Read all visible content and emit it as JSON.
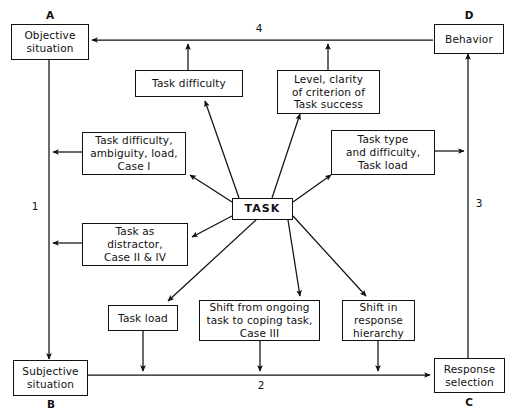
{
  "diagram": {
    "nodes": [
      {
        "id": "objective_situation",
        "label": "Objective\nsituation"
      },
      {
        "id": "behavior",
        "label": "Behavior"
      },
      {
        "id": "task_difficulty",
        "label": "Task difficulty"
      },
      {
        "id": "level_clarity",
        "label": "Level, clarity\nof criterion of\nTask success"
      },
      {
        "id": "task_difficulty_ambiguity",
        "label": "Task difficulty,\nambiguity, load,\nCase I"
      },
      {
        "id": "task_type",
        "label": "Task type\nand difficulty,\nTask load"
      },
      {
        "id": "task",
        "label": "TASK"
      },
      {
        "id": "task_as_distractor",
        "label": "Task as\ndistractor,\nCase II & IV"
      },
      {
        "id": "task_load",
        "label": "Task load"
      },
      {
        "id": "shift_from_ongoing",
        "label": "Shift from ongoing\ntask to coping task,\nCase III"
      },
      {
        "id": "shift_in_response",
        "label": "Shift in\nresponse\nhierarchy"
      },
      {
        "id": "subjective_situation",
        "label": "Subjective\nsituation"
      },
      {
        "id": "response_selection",
        "label": "Response\nselection"
      }
    ],
    "corner_labels": [
      {
        "id": "corner_a",
        "text": "A"
      },
      {
        "id": "corner_b",
        "text": "B"
      },
      {
        "id": "corner_c",
        "text": "C"
      },
      {
        "id": "corner_d",
        "text": "D"
      }
    ],
    "edge_labels": [
      {
        "id": "path_1",
        "text": "1"
      },
      {
        "id": "path_2",
        "text": "2"
      },
      {
        "id": "path_3",
        "text": "3"
      },
      {
        "id": "path_4",
        "text": "4"
      }
    ],
    "colors": {
      "stroke": "#111111",
      "background": "#ffffff"
    }
  }
}
